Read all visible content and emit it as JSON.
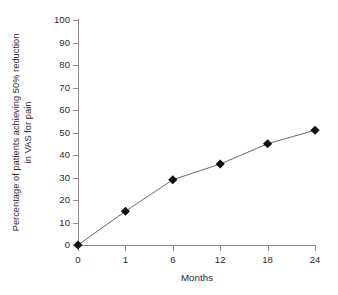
{
  "chart_data": {
    "type": "line",
    "title": "",
    "xlabel": "Months",
    "ylabel": "Percentage of patients achieving 50% reduction in VAS for pain",
    "ylabel_line1": "Percentage of patients achieving 50% reduction",
    "ylabel_line2": "in VAS for pain",
    "categories": [
      "0",
      "1",
      "6",
      "12",
      "18",
      "24"
    ],
    "x": [
      0,
      1,
      6,
      12,
      18,
      24
    ],
    "values": [
      0,
      15,
      29,
      36,
      45,
      51
    ],
    "ylim": [
      0,
      100
    ],
    "yticks": [
      "100",
      "90",
      "80",
      "70",
      "60",
      "50",
      "40",
      "30",
      "20",
      "10",
      "0"
    ],
    "ytick_values": [
      100,
      90,
      80,
      70,
      60,
      50,
      40,
      30,
      20,
      10,
      0
    ],
    "xticks": [
      "0",
      "1",
      "6",
      "12",
      "18",
      "24"
    ],
    "grid": false,
    "legend": false,
    "legend_position": "none",
    "marker": "diamond",
    "marker_color": "#101010",
    "line_color": "#6b6b6b",
    "axis_color": "#8a8a8a",
    "text_color": "#2b2b2b",
    "background": "#ffffff"
  }
}
